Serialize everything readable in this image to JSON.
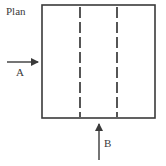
{
  "diagram": {
    "title": "Plan",
    "colors": {
      "stroke": "#3a3a3a",
      "dash": "#444444",
      "background": "#ffffff"
    },
    "square": {
      "x": 42,
      "y": 5,
      "width": 113,
      "height": 113
    },
    "dashed_lines": [
      {
        "x": 80,
        "y1": 7,
        "y2": 116
      },
      {
        "x": 117,
        "y1": 7,
        "y2": 116
      }
    ],
    "arrows": [
      {
        "id": "A",
        "label": "A",
        "direction": "right",
        "x1": 7,
        "y1": 62,
        "x2": 38,
        "y2": 62
      },
      {
        "id": "B",
        "label": "B",
        "direction": "up",
        "x1": 99,
        "y1": 160,
        "x2": 99,
        "y2": 124
      }
    ]
  }
}
